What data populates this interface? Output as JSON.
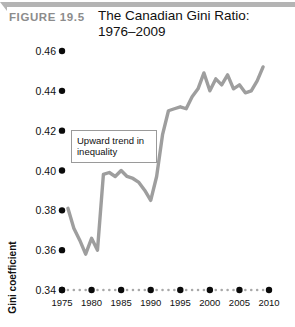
{
  "header": {
    "figure_number": "FIGURE  19.5",
    "title": "The Canadian Gini Ratio: 1976–2009",
    "rule_color": "#b4b4b4"
  },
  "annotation": {
    "text": "Upward trend in inequality",
    "border_color": "#9a9a9a"
  },
  "colors": {
    "line": "#9e9e9e",
    "tick_dot": "#0a0a0a",
    "minor_dot": "#a8a8a8",
    "text": "#111111",
    "figure_number": "#8c8c8c"
  },
  "chart_data": {
    "type": "line",
    "title": "The Canadian Gini Ratio: 1976–2009",
    "xlabel": "Year",
    "ylabel": "Gini coefficient",
    "xlim": [
      1975,
      2010
    ],
    "ylim": [
      0.34,
      0.46
    ],
    "ytick_labels": [
      "0.46",
      "0.44",
      "0.42",
      "0.40",
      "0.38",
      "0.36",
      "0.34"
    ],
    "yticks": [
      0.46,
      0.44,
      0.42,
      0.4,
      0.38,
      0.36,
      0.34
    ],
    "xtick_labels": [
      "1975",
      "1980",
      "1985",
      "1990",
      "1995",
      "2000",
      "2005",
      "2010"
    ],
    "xticks": [
      1975,
      1980,
      1985,
      1990,
      1995,
      2000,
      2005,
      2010
    ],
    "grid": false,
    "legend": "none",
    "series": [
      {
        "name": "Gini coefficient",
        "x": [
          1976,
          1977,
          1978,
          1979,
          1980,
          1981,
          1982,
          1983,
          1984,
          1985,
          1986,
          1987,
          1988,
          1989,
          1990,
          1991,
          1992,
          1993,
          1994,
          1995,
          1996,
          1997,
          1998,
          1999,
          2000,
          2001,
          2002,
          2003,
          2004,
          2005,
          2006,
          2007,
          2008,
          2009
        ],
        "values": [
          0.381,
          0.371,
          0.365,
          0.358,
          0.366,
          0.36,
          0.398,
          0.399,
          0.397,
          0.4,
          0.397,
          0.396,
          0.394,
          0.39,
          0.385,
          0.397,
          0.418,
          0.43,
          0.431,
          0.432,
          0.431,
          0.437,
          0.441,
          0.449,
          0.44,
          0.446,
          0.443,
          0.448,
          0.441,
          0.443,
          0.439,
          0.44,
          0.445,
          0.452
        ]
      }
    ],
    "annotations": [
      {
        "text": "Upward trend in inequality",
        "x": 1983,
        "y": 0.425
      }
    ]
  }
}
